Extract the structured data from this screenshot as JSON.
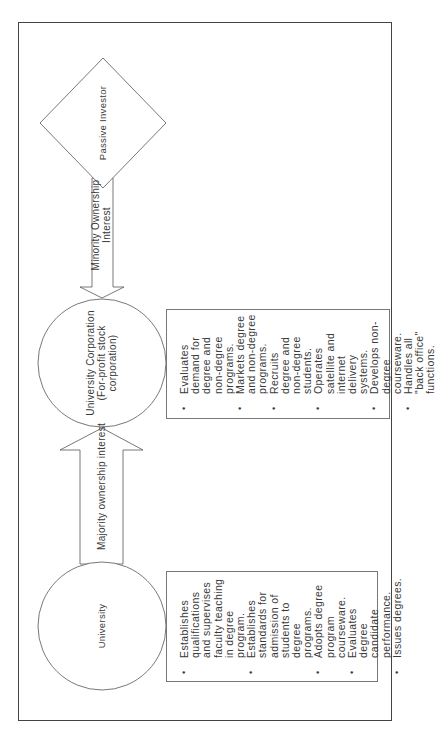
{
  "diagram": {
    "orientation": "rotated-90-counterclockwise",
    "nodes": {
      "passive_investor": {
        "label": "Passive Investor",
        "shape": "diamond"
      },
      "university_corporation": {
        "label_line1": "University Corporation",
        "label_line2": "(For-profit stock",
        "label_line3": "corporation)",
        "shape": "circle"
      },
      "university": {
        "label": "University",
        "shape": "circle"
      }
    },
    "edges": {
      "minority": {
        "label_line1": "Minority Ownership",
        "label_line2": "Interest",
        "from": "Passive Investor",
        "to": "University Corporation"
      },
      "majority": {
        "label": "Majority ownership interest",
        "from": "University",
        "to": "University Corporation"
      }
    },
    "corporation_functions": [
      "Evaluates demand for degree and non-degree programs.",
      "Markets degree and non-degree programs.",
      "Recruits degree and non-degree students.",
      "Operates satellite and internet delivery systems.",
      "Develops non-degree courseware.",
      "Handles all \"back office\" functions."
    ],
    "university_functions": [
      "Establishes qualifications and supervises faculty teaching in degree program.",
      "Establishes standards for admission of students to degree programs.",
      "Adopts degree program courseware.",
      "Evaluates degree candidate performance.",
      "Issues degrees."
    ],
    "colors": {
      "stroke": "#555555",
      "text": "#3a3a3a",
      "background": "#ffffff"
    }
  }
}
